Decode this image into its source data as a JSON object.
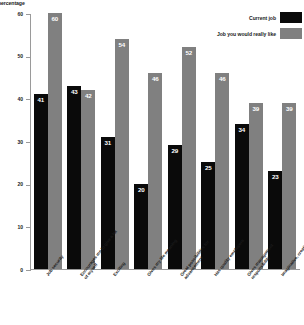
{
  "chart_data": {
    "type": "bar",
    "title": "",
    "xlabel": "",
    "ylabel": "percentage",
    "ylim": [
      0,
      60
    ],
    "yticks": [
      0,
      10,
      20,
      30,
      40,
      50,
      60
    ],
    "grid": false,
    "legend_position": "top-right",
    "categories": [
      "Job security",
      "Encourages me to give a lot of myself",
      "Exciting",
      "Gives my life meaning",
      "Great possibilities for advancement",
      "Has quality employers",
      "Gives management responsibility",
      "Imaginative, creative work"
    ],
    "series": [
      {
        "name": "Current job",
        "color": "#0a0a0a",
        "values": [
          41,
          43,
          31,
          20,
          29,
          25,
          34,
          23
        ]
      },
      {
        "name": "Job you would really like",
        "color": "#808080",
        "values": [
          60,
          42,
          54,
          46,
          52,
          46,
          39,
          39
        ]
      }
    ]
  },
  "legend": {
    "items": [
      {
        "label": "Current job",
        "color": "#0a0a0a"
      },
      {
        "label": "Job you would really like",
        "color": "#808080"
      }
    ]
  },
  "axis": {
    "y_title": "percentage",
    "y_ticks": [
      "60",
      "50",
      "40",
      "30",
      "20",
      "10",
      "0"
    ]
  }
}
